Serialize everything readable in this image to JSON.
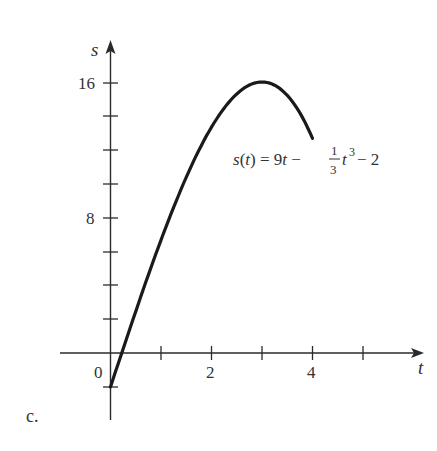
{
  "chart_data": {
    "type": "line",
    "title": "",
    "panel_label": "c.",
    "xlabel": "t",
    "ylabel": "s",
    "function": "s(t) = 9t - (1/3)t^3 - 2",
    "annotation": {
      "prefix": "s(t) = 9t − ",
      "frac_num": "1",
      "frac_den": "3",
      "var": "t",
      "exp": "3",
      "suffix": " − 2"
    },
    "x_ticks": [
      0,
      1,
      2,
      3,
      4,
      5
    ],
    "x_tick_labels": [
      {
        "value": 0,
        "label": "0"
      },
      {
        "value": 2,
        "label": "2"
      },
      {
        "value": 4,
        "label": "4"
      }
    ],
    "y_ticks": [
      -2,
      2,
      4,
      6,
      8,
      10,
      12,
      14,
      16
    ],
    "y_tick_labels": [
      {
        "value": 8,
        "label": "8"
      },
      {
        "value": 16,
        "label": "16"
      }
    ],
    "xlim": [
      -1,
      6.2
    ],
    "ylim": [
      -4,
      18.5
    ],
    "domain": [
      0,
      4
    ],
    "series": [
      {
        "name": "s(t)",
        "x": [
          0,
          0.5,
          1,
          1.5,
          2,
          2.5,
          3,
          3.5,
          4
        ],
        "y": [
          -2,
          2.46,
          6.67,
          10.38,
          13.33,
          15.29,
          16,
          15.21,
          12.67
        ]
      }
    ],
    "grid": false,
    "legend": "none"
  },
  "labels": {
    "s_axis": "s",
    "t_axis": "t",
    "origin": "0",
    "x2": "2",
    "x4": "4",
    "y8": "8",
    "y16": "16",
    "panel": "c."
  }
}
